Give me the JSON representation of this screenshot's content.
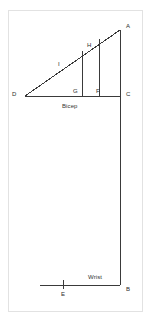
{
  "figure": {
    "stroke_color": "#3a3a3a",
    "frame_color": "#e2e2e2",
    "background_color": "#ffffff",
    "text_color": "#2b2b2b"
  },
  "vertices": [
    {
      "id": "A",
      "label": "A",
      "x": 120,
      "y": 30,
      "label_x": 126,
      "label_y": 23
    },
    {
      "id": "B",
      "label": "B",
      "x": 120,
      "y": 285,
      "label_x": 126,
      "label_y": 286
    },
    {
      "id": "C",
      "label": "C",
      "x": 120,
      "y": 96,
      "label_x": 126,
      "label_y": 91
    },
    {
      "id": "D",
      "label": "D",
      "x": 25,
      "y": 96,
      "label_x": 12,
      "label_y": 91
    },
    {
      "id": "E",
      "label": "E",
      "x": 63,
      "y": 285,
      "label_x": 61,
      "label_y": 291
    },
    {
      "id": "F",
      "label": "F",
      "x": 99,
      "y": 96,
      "label_x": 96,
      "label_y": 88
    },
    {
      "id": "G",
      "label": "G",
      "x": 82,
      "y": 96,
      "label_x": 73,
      "label_y": 88
    },
    {
      "id": "H",
      "label": "H",
      "x": 82,
      "y": 51,
      "label_x": 87,
      "label_y": 42
    },
    {
      "id": "I",
      "label": "I",
      "x": 58,
      "y": 70,
      "label_x": 58,
      "label_y": 61
    }
  ],
  "segments": [
    {
      "name": "hypotenuse-D-A",
      "x1": 25,
      "y1": 96,
      "x2": 120,
      "y2": 30
    },
    {
      "name": "base-D-C",
      "x1": 25,
      "y1": 96,
      "x2": 120,
      "y2": 96
    },
    {
      "name": "upper-vertical-A-C",
      "x1": 120,
      "y1": 30,
      "x2": 120,
      "y2": 96
    },
    {
      "name": "forearm-vertical-C-B",
      "x1": 120,
      "y1": 96,
      "x2": 120,
      "y2": 285
    },
    {
      "name": "inner-vertical-G-H",
      "x1": 82,
      "y1": 96,
      "x2": 82,
      "y2": 51
    },
    {
      "name": "inner-vertical-F",
      "x1": 99,
      "y1": 96,
      "x2": 99,
      "y2": 39
    },
    {
      "name": "wrist-base-E-B",
      "x1": 40,
      "y1": 285,
      "x2": 120,
      "y2": 285
    },
    {
      "name": "wrist-tick-E",
      "x1": 63,
      "y1": 280,
      "x2": 63,
      "y2": 289
    }
  ],
  "annotations": [
    {
      "name": "bicep-label",
      "text": "Bicep",
      "x": 62,
      "y": 103
    },
    {
      "name": "wrist-label",
      "text": "Wrist",
      "x": 88,
      "y": 274
    }
  ]
}
